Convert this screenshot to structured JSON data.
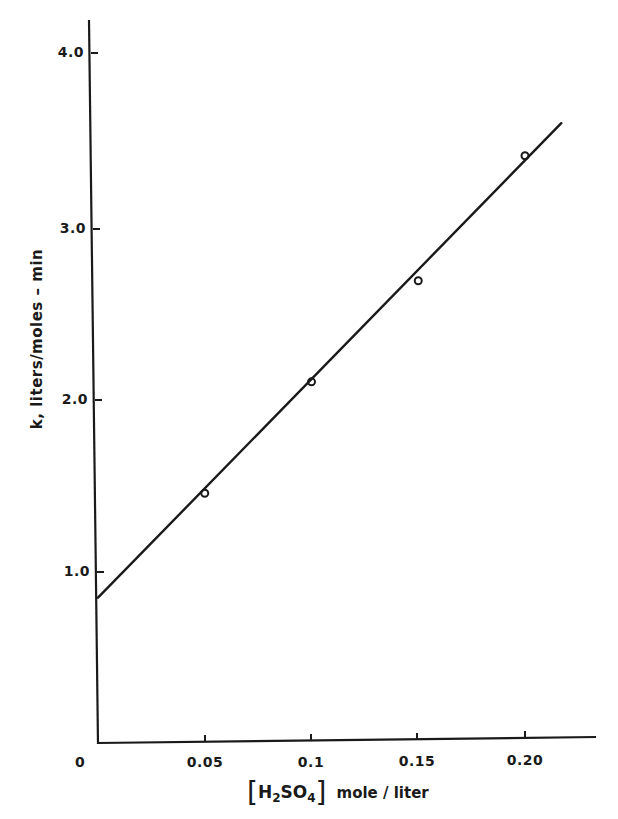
{
  "chart_data": {
    "type": "scatter",
    "title": "",
    "xlabel": "[H2SO4] mole/liter",
    "ylabel": "k, liters/moles - min",
    "xlim": [
      0,
      0.23
    ],
    "ylim": [
      0,
      4.2
    ],
    "x_ticks": [
      "0.05",
      "0.1",
      "0.15",
      "0.20"
    ],
    "x_origin_label": "0",
    "y_ticks": [
      "1.0",
      "2.0",
      "3.0",
      "4.0"
    ],
    "grid": false,
    "legend": null,
    "series": [
      {
        "name": "measured",
        "type": "scatter",
        "x": [
          0.05,
          0.1,
          0.15,
          0.2
        ],
        "y": [
          1.46,
          2.11,
          2.7,
          3.43
        ]
      },
      {
        "name": "linear fit",
        "type": "line",
        "x": [
          0.0,
          0.217
        ],
        "y": [
          0.85,
          3.62
        ]
      }
    ]
  },
  "labels": {
    "y_axis_title": "k,  liters/moles – min",
    "x_axis_bracket_open": "[",
    "x_axis_species_main": "H",
    "x_axis_species_sub1": "2",
    "x_axis_species_mid": "SO",
    "x_axis_species_sub2": "4",
    "x_axis_bracket_close": "]",
    "x_axis_unit": "mole / liter",
    "x_origin": "0",
    "x_tick_1": "0.05",
    "x_tick_2": "0.1",
    "x_tick_3": "0.15",
    "x_tick_4": "0.20",
    "y_tick_1": "1.0",
    "y_tick_2": "2.0",
    "y_tick_3": "3.0",
    "y_tick_4": "4.0"
  },
  "colors": {
    "ink": "#1a1a1a",
    "background": "#ffffff"
  }
}
